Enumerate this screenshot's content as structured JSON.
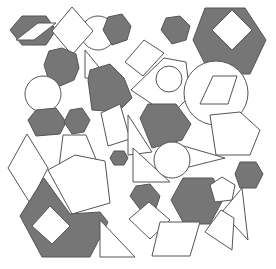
{
  "canvas": {
    "width": 276,
    "height": 269,
    "background": "#ffffff"
  },
  "palette": {
    "fill_dark": "#767676",
    "fill_light": "#ffffff",
    "stroke": "#555555"
  },
  "shapes": [
    {
      "name": "hexagon-dark-topleft",
      "type": "polygon",
      "fill": "dark",
      "points": "10,30 22,16 46,16 56,30 46,45 22,45"
    },
    {
      "name": "diamond-white-in-hexagon-topleft",
      "type": "polygon",
      "fill": "light",
      "points": "16,40 38,23 56,23 34,40"
    },
    {
      "name": "circle-white-top",
      "type": "circle",
      "fill": "light",
      "cx": 98,
      "cy": 33,
      "r": 17
    },
    {
      "name": "diamond-white-top",
      "type": "polygon",
      "fill": "light",
      "points": "72,7 93,31 72,55 52,31"
    },
    {
      "name": "hexagon-dark-top",
      "type": "polygon",
      "fill": "dark",
      "points": "103,30 108,17 122,14 131,26 127,40 112,45"
    },
    {
      "name": "hexagon-dark-left",
      "type": "polygon",
      "fill": "dark",
      "points": "44,65 49,51 62,48 76,54 79,68 74,80 60,86 48,78"
    },
    {
      "name": "triangle-white-left",
      "type": "polygon",
      "fill": "light",
      "points": "85,50 85,78 108,78"
    },
    {
      "name": "circle-white-left",
      "type": "circle",
      "fill": "light",
      "cx": 43,
      "cy": 94,
      "r": 18
    },
    {
      "name": "hexagon-dark-center-left",
      "type": "polygon",
      "fill": "dark",
      "points": "88,80 90,70 110,64 124,78 132,98 118,112 92,110"
    },
    {
      "name": "diamond-white-center",
      "type": "polygon",
      "fill": "light",
      "points": "125,62 144,40 164,53 143,76"
    },
    {
      "name": "hexagon-dark-bottomleft-small",
      "type": "polygon",
      "fill": "dark",
      "points": "28,120 36,110 56,108 66,122 60,134 36,136"
    },
    {
      "name": "hexagon-dark-left-small",
      "type": "polygon",
      "fill": "dark",
      "points": "64,122 70,110 82,108 90,120 84,132 72,134"
    },
    {
      "name": "pentagon-white-center",
      "type": "polygon",
      "fill": "light",
      "points": "131,90 164,58 186,62 190,96 170,116"
    },
    {
      "name": "circle-white-center-small",
      "type": "circle",
      "fill": "light",
      "cx": 169,
      "cy": 79,
      "r": 13
    },
    {
      "name": "hexagon-dark-top-right-small",
      "type": "polygon",
      "fill": "dark",
      "points": "161,30 166,18 180,16 190,26 186,40 172,44"
    },
    {
      "name": "hexagon-dark-top-right-large",
      "type": "polygon",
      "fill": "dark",
      "points": "193,40 205,8 245,8 266,40 250,74 210,74"
    },
    {
      "name": "diamond-white-in-hexagon-topright",
      "type": "polygon",
      "fill": "light",
      "points": "212,30 232,10 252,30 232,50"
    },
    {
      "name": "circle-white-right",
      "type": "circle",
      "fill": "light",
      "cx": 216,
      "cy": 93,
      "r": 32
    },
    {
      "name": "rhombus-outline-in-circle-right",
      "type": "polygon",
      "fill": "light",
      "points": "213,76 237,76 228,104 200,104"
    },
    {
      "name": "quad-white-center-left",
      "type": "polygon",
      "fill": "light",
      "points": "101,113 120,104 130,139 108,146"
    },
    {
      "name": "triangle-white-center",
      "type": "polygon",
      "fill": "light",
      "points": "128,115 152,152 128,155"
    },
    {
      "name": "hexagon-dark-center",
      "type": "polygon",
      "fill": "dark",
      "points": "140,118 148,104 176,104 191,124 182,140 152,148"
    },
    {
      "name": "pentagon-white-right",
      "type": "polygon",
      "fill": "light",
      "points": "210,115 240,112 260,130 250,155 216,155"
    },
    {
      "name": "triangle-white-right",
      "type": "polygon",
      "fill": "light",
      "points": "180,145 225,158 185,168"
    },
    {
      "name": "diamond-white-left",
      "type": "polygon",
      "fill": "light",
      "points": "8,168 27,134 48,168 30,203"
    },
    {
      "name": "trapezoid-white-left",
      "type": "polygon",
      "fill": "light",
      "points": "63,135 86,135 98,164 59,167"
    },
    {
      "name": "hexagon-dark-small-center",
      "type": "polygon",
      "fill": "dark",
      "points": "110,158 114,151 124,151 128,158 124,165 114,165"
    },
    {
      "name": "pentagon-white-large-left",
      "type": "polygon",
      "fill": "light",
      "points": "48,170 75,155 105,161 110,203 72,214"
    },
    {
      "name": "hexagon-dark-bottomleft-large",
      "type": "polygon",
      "fill": "dark",
      "points": "20,216 44,178 70,214 100,212 108,222 90,257 42,257"
    },
    {
      "name": "diamond-white-in-hexagon-bottomleft",
      "type": "polygon",
      "fill": "light",
      "points": "32,226 50,206 70,226 52,244"
    },
    {
      "name": "triangle-white-bottom-left",
      "type": "polygon",
      "fill": "light",
      "points": "100,220 100,257 135,257"
    },
    {
      "name": "triangle-white-center-bottom",
      "type": "polygon",
      "fill": "light",
      "points": "133,148 133,182 170,182"
    },
    {
      "name": "circle-white-center-bottom",
      "type": "circle",
      "fill": "light",
      "cx": 172,
      "cy": 160,
      "r": 18
    },
    {
      "name": "hexagon-dark-bottom-center",
      "type": "polygon",
      "fill": "dark",
      "points": "130,196 136,186 150,184 160,196 156,208 142,212"
    },
    {
      "name": "rhombus-white-bottom-center",
      "type": "polygon",
      "fill": "light",
      "points": "129,219 149,202 170,220 150,239"
    },
    {
      "name": "hexagon-dark-bottom-right",
      "type": "polygon",
      "fill": "dark",
      "points": "171,200 183,178 213,178 224,198 210,224 184,224"
    },
    {
      "name": "pentagon-white-bottom-right",
      "type": "polygon",
      "fill": "light",
      "points": "210,185 222,177 235,185 232,200 215,202"
    },
    {
      "name": "hexagon-dark-right",
      "type": "polygon",
      "fill": "dark",
      "points": "235,174 240,162 256,162 263,174 256,188 240,188"
    },
    {
      "name": "triangle-white-right-bottom",
      "type": "polygon",
      "fill": "light",
      "points": "242,188 248,240 222,212"
    },
    {
      "name": "quad-white-right-bottom",
      "type": "polygon",
      "fill": "light",
      "points": "205,232 221,210 234,218 232,250"
    },
    {
      "name": "rhombus-white-bottom-right",
      "type": "polygon",
      "fill": "light",
      "points": "160,222 200,222 190,256 152,256"
    }
  ]
}
